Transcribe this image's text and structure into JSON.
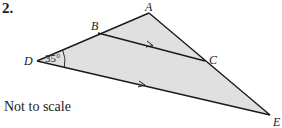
{
  "question": {
    "number": "2."
  },
  "note": "Not to scale",
  "figure": {
    "fill_color": "#e0e0e0",
    "stroke_color": "#1a1a1a",
    "points": {
      "A": {
        "label": "A",
        "x": 149,
        "y": 13
      },
      "B": {
        "label": "B",
        "x": 98,
        "y": 33
      },
      "C": {
        "label": "C",
        "x": 205,
        "y": 61
      },
      "D": {
        "label": "D",
        "x": 37,
        "y": 61
      },
      "E": {
        "label": "E",
        "x": 270,
        "y": 115
      }
    },
    "segments": [
      "DA",
      "AE",
      "DE",
      "BC"
    ],
    "parallel_marks": [
      "BC",
      "DE"
    ],
    "angle": {
      "vertex": "D",
      "value": "35°"
    }
  }
}
